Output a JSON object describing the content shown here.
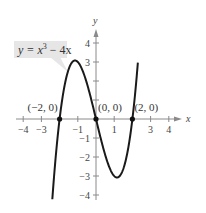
{
  "chart_data": {
    "type": "line",
    "title": "",
    "equation_label": {
      "prefix": "y = x",
      "exponent": "3",
      "suffix": " − 4x"
    },
    "xlabel": "x",
    "ylabel": "y",
    "xlim": [
      -4.3,
      4.6
    ],
    "ylim": [
      -4.3,
      4.8
    ],
    "grid": false,
    "x_ticks": [
      -4,
      -3,
      -2,
      -1,
      1,
      2,
      3,
      4
    ],
    "x_tick_labels": [
      "−4",
      "−3",
      "−1",
      "1",
      "3",
      "4"
    ],
    "x_tick_label_values": [
      -4,
      -3,
      -1,
      1,
      3,
      4
    ],
    "y_ticks": [
      -4,
      -3,
      -2,
      -1,
      1,
      2,
      3,
      4
    ],
    "y_tick_labels": [
      "4",
      "3",
      "−1",
      "−2",
      "−3",
      "−4"
    ],
    "y_tick_label_values": [
      4,
      3,
      -1,
      -2,
      -3,
      -4
    ],
    "series": [
      {
        "name": "y = x^3 - 4x",
        "function": "x^3 - 4x",
        "x_range": [
          -2.4,
          2.3
        ],
        "color": "#1a1a1a"
      }
    ],
    "points": [
      {
        "label": "(−2, 0)",
        "x": -2,
        "y": 0
      },
      {
        "label": "(0, 0)",
        "x": 0,
        "y": 0
      },
      {
        "label": "(2, 0)",
        "x": 2,
        "y": 0
      }
    ],
    "colors": {
      "curve": "#1a1a1a",
      "axis": "#8a8a8a",
      "label_box": "#e6e6e6"
    }
  }
}
